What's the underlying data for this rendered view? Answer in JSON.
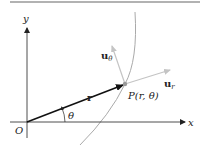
{
  "diagram": {
    "type": "polar-unit-vectors",
    "labels": {
      "y_axis": "y",
      "x_axis": "x",
      "origin": "O",
      "position_vector": "r",
      "angle": "θ",
      "point": "P(r, θ)",
      "unit_radial": "u",
      "unit_radial_sub": "r",
      "unit_angular": "u",
      "unit_angular_sub": "θ"
    },
    "colors": {
      "axis": "#222222",
      "vector": "#111111",
      "unit_vectors": "#bbbbbb",
      "curve": "#aaaaaa",
      "rule": "#999999",
      "point": "#999999"
    }
  }
}
